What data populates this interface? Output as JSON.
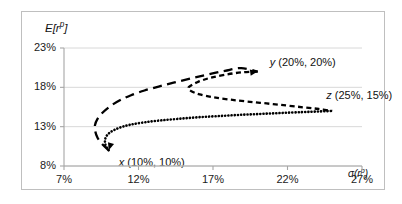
{
  "chart_data": {
    "type": "line",
    "title": "",
    "subtitle": "",
    "xlabel": "σ(rᵖ)",
    "ylabel": "E[rᵖ]",
    "xlabel_base": "σ(r",
    "xlabel_sup": "p",
    "xlabel_tail": ")",
    "ylabel_base": "E[r",
    "ylabel_sup": "p",
    "ylabel_tail": "]",
    "xlim": [
      7,
      27
    ],
    "ylim": [
      8,
      23
    ],
    "xticks": [
      "7%",
      "12%",
      "17%",
      "22%",
      "27%"
    ],
    "xtick_values": [
      7,
      12,
      17,
      22,
      27
    ],
    "yticks": [
      "8%",
      "13%",
      "18%",
      "23%"
    ],
    "ytick_values": [
      8,
      13,
      18,
      23
    ],
    "grid": true,
    "grid_axis": "y",
    "legend": "none",
    "annotations": [
      {
        "id": "x",
        "name": "x",
        "coords": "(10%, 10%)",
        "label": "x (10%, 10%)",
        "sigma": 10,
        "mean": 10
      },
      {
        "id": "y",
        "name": "y",
        "coords": "(20%, 20%)",
        "label": "y (20%, 20%)",
        "sigma": 20,
        "mean": 20
      },
      {
        "id": "z",
        "name": "z",
        "coords": "(25%, 15%)",
        "label": "z (25%, 15%)",
        "sigma": 25,
        "mean": 15
      }
    ],
    "series": [
      {
        "name": "x-y frontier",
        "style": "long-dash",
        "points": [
          [
            10.0,
            10.0
          ],
          [
            9.55,
            10.8
          ],
          [
            9.25,
            11.6
          ],
          [
            9.1,
            12.4
          ],
          [
            9.08,
            13.2
          ],
          [
            9.25,
            14.0
          ],
          [
            9.6,
            14.8
          ],
          [
            10.1,
            15.6
          ],
          [
            10.75,
            16.35
          ],
          [
            11.5,
            17.0
          ],
          [
            12.4,
            17.6
          ],
          [
            13.35,
            18.1
          ],
          [
            14.35,
            18.6
          ],
          [
            15.45,
            19.1
          ],
          [
            16.6,
            19.6
          ],
          [
            17.8,
            20.1
          ],
          [
            18.9,
            20.45
          ],
          [
            20.0,
            20.0
          ]
        ]
      },
      {
        "name": "y-z frontier",
        "style": "short-dash",
        "points": [
          [
            20.0,
            20.0
          ],
          [
            18.9,
            19.9
          ],
          [
            17.8,
            19.6
          ],
          [
            16.8,
            19.2
          ],
          [
            16.0,
            18.7
          ],
          [
            15.5,
            18.2
          ],
          [
            15.35,
            17.9
          ],
          [
            15.55,
            17.5
          ],
          [
            16.1,
            17.1
          ],
          [
            17.0,
            16.75
          ],
          [
            18.1,
            16.45
          ],
          [
            19.3,
            16.2
          ],
          [
            20.6,
            15.95
          ],
          [
            21.9,
            15.7
          ],
          [
            23.1,
            15.45
          ],
          [
            24.1,
            15.25
          ],
          [
            25.0,
            15.0
          ]
        ]
      },
      {
        "name": "x-z frontier",
        "style": "dotted",
        "points": [
          [
            10.0,
            10.0
          ],
          [
            9.8,
            10.6
          ],
          [
            9.75,
            11.2
          ],
          [
            9.85,
            11.8
          ],
          [
            10.15,
            12.35
          ],
          [
            10.7,
            12.85
          ],
          [
            11.45,
            13.25
          ],
          [
            12.4,
            13.55
          ],
          [
            13.5,
            13.8
          ],
          [
            14.7,
            14.0
          ],
          [
            16.0,
            14.2
          ],
          [
            17.4,
            14.35
          ],
          [
            18.8,
            14.5
          ],
          [
            20.2,
            14.62
          ],
          [
            21.6,
            14.74
          ],
          [
            23.0,
            14.85
          ],
          [
            24.1,
            14.93
          ],
          [
            25.0,
            15.0
          ]
        ]
      }
    ]
  },
  "axes": {
    "y_title": "E[r p ]",
    "x_title": "σ(r p )"
  }
}
